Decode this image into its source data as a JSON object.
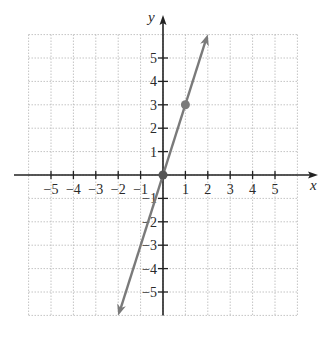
{
  "chart_data": {
    "type": "line",
    "title": "",
    "xlabel": "x",
    "ylabel": "y",
    "xlim": [
      -6,
      6
    ],
    "ylim": [
      -6,
      6
    ],
    "grid": true,
    "x_ticks": [
      -5,
      -4,
      -3,
      -2,
      -1,
      1,
      2,
      3,
      4,
      5
    ],
    "y_ticks": [
      -5,
      -4,
      -3,
      -2,
      -1,
      1,
      2,
      3,
      4,
      5
    ],
    "x_tick_labels": [
      "−5",
      "−4",
      "−3",
      "−2",
      "−1",
      "1",
      "2",
      "3",
      "4",
      "5"
    ],
    "y_tick_labels": [
      "−5",
      "−4",
      "−3",
      "−2",
      "−1",
      "1",
      "2",
      "3",
      "4",
      "5"
    ],
    "series": [
      {
        "name": "y = 3x",
        "equation": "y = 3x",
        "x": [
          -2,
          2
        ],
        "y": [
          -6,
          6
        ],
        "arrows_both_ends": true,
        "color": "#7a7a7a"
      }
    ],
    "points": [
      {
        "x": 0,
        "y": 0,
        "color": "#555555"
      },
      {
        "x": 1,
        "y": 3,
        "color": "#7a7a7a"
      }
    ]
  },
  "colors": {
    "axes": "#222222",
    "grid": "#b5b5b5",
    "line": "#7a7a7a"
  }
}
